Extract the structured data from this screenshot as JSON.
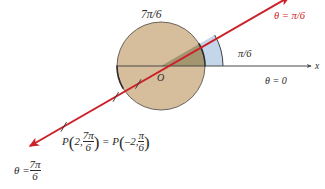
{
  "figure": {
    "background_color": "#ffffff",
    "colors": {
      "ray": "#cc2128",
      "circle_fill": "#d6bd9c",
      "circle_stroke": "#4a4a48",
      "wedge_fill": "#9a8f6a",
      "sector_fill": "#b9cfe6",
      "sector_stroke": "#3a3a38",
      "axis": "#4a4a48",
      "text": "#2c2a28"
    }
  },
  "labels": {
    "top_angle": "7π/6",
    "ray_angle": "θ = π/6",
    "sector_angle": "π/6",
    "axis_angle": "θ = 0",
    "axis_name": "x",
    "origin": "O",
    "opposite_ray_theta": "θ =",
    "opposite_ray_num": "7π",
    "opposite_ray_den": "6"
  },
  "point_equation": {
    "p1_name": "P",
    "p1_open": "(",
    "p1_r": "2,",
    "p1_num": "7π",
    "p1_den": "6",
    "p1_close": ")",
    "equals": "=",
    "p2_name": "P",
    "p2_open": "(",
    "p2_r": "–2,",
    "p2_num": "π",
    "p2_den": "6",
    "p2_close": ")"
  },
  "geometry": {
    "origin_x": 161,
    "origin_y": 66,
    "circle_radius": 44,
    "sector_outer_radius": 62,
    "ray_angle_deg": 30,
    "tick_count": 2
  }
}
